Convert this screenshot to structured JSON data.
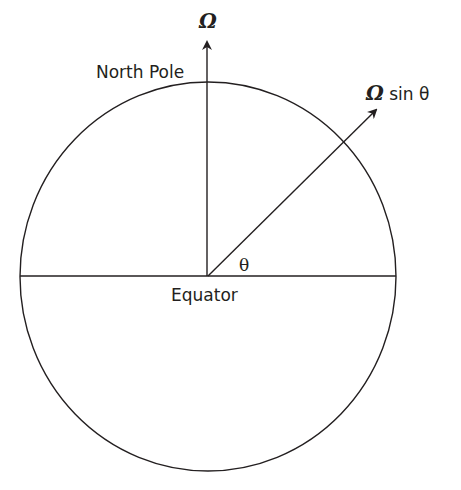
{
  "diagram": {
    "type": "earth-rotation-component",
    "labels": {
      "omega_axis": "Ω",
      "north_pole": "North Pole",
      "omega_component_symbol": "Ω",
      "omega_component_rest": " sin θ",
      "angle": "θ",
      "equator": "Equator"
    },
    "colors": {
      "stroke": "#231f20",
      "background": "#ffffff"
    },
    "elements": [
      "circle (Earth cross-section)",
      "horizontal equator line",
      "vertical rotation axis arrow",
      "diagonal arrow at angle θ from equator"
    ]
  }
}
